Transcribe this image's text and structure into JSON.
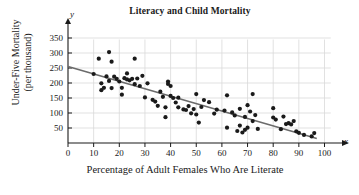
{
  "chart_data": {
    "type": "scatter",
    "title": "Literacy and Child Mortality",
    "xlabel": "Percentage of Adult Females Who Are Literate",
    "ylabel_line1": "Under-Five Mortality",
    "ylabel_line2": "(per thousand)",
    "x_axis_symbol": "x",
    "y_axis_symbol": "y",
    "xlim": [
      0,
      104
    ],
    "ylim": [
      0,
      365
    ],
    "xticks": [
      0,
      10,
      20,
      30,
      40,
      50,
      60,
      70,
      80,
      90,
      100
    ],
    "yticks": [
      50,
      100,
      150,
      200,
      250,
      300,
      350
    ],
    "grid": true,
    "legend": "none",
    "point_color": "#1a1a1a",
    "line_color": "#6b6b6b",
    "grid_color": "#d9d9d9",
    "trendline": {
      "label": "regression line",
      "x": [
        0,
        97
      ],
      "y": [
        255,
        15
      ]
    },
    "points": [
      [
        10,
        230
      ],
      [
        12,
        281
      ],
      [
        13,
        176
      ],
      [
        13,
        199
      ],
      [
        14,
        184
      ],
      [
        15,
        222
      ],
      [
        16,
        303
      ],
      [
        16,
        207
      ],
      [
        17,
        271
      ],
      [
        17,
        183
      ],
      [
        18,
        221
      ],
      [
        19,
        214
      ],
      [
        20,
        205
      ],
      [
        21,
        184
      ],
      [
        21,
        161
      ],
      [
        22,
        216
      ],
      [
        23,
        232
      ],
      [
        23,
        212
      ],
      [
        24,
        209
      ],
      [
        25,
        214
      ],
      [
        26,
        281
      ],
      [
        26,
        196
      ],
      [
        27,
        215
      ],
      [
        28,
        190
      ],
      [
        29,
        224
      ],
      [
        30,
        152
      ],
      [
        31,
        199
      ],
      [
        33,
        144
      ],
      [
        34,
        138
      ],
      [
        35,
        124
      ],
      [
        36,
        171
      ],
      [
        37,
        154
      ],
      [
        38,
        119
      ],
      [
        38,
        86
      ],
      [
        39,
        205
      ],
      [
        39,
        197
      ],
      [
        40,
        190
      ],
      [
        40,
        157
      ],
      [
        41,
        150
      ],
      [
        42,
        135
      ],
      [
        43,
        151
      ],
      [
        43,
        119
      ],
      [
        45,
        112
      ],
      [
        46,
        110
      ],
      [
        47,
        123
      ],
      [
        48,
        99
      ],
      [
        49,
        113
      ],
      [
        50,
        163
      ],
      [
        50,
        95
      ],
      [
        51,
        68
      ],
      [
        52,
        120
      ],
      [
        53,
        143
      ],
      [
        55,
        136
      ],
      [
        57,
        98
      ],
      [
        58,
        111
      ],
      [
        61,
        108
      ],
      [
        62,
        159
      ],
      [
        62,
        51
      ],
      [
        64,
        102
      ],
      [
        65,
        92
      ],
      [
        66,
        40
      ],
      [
        67,
        114
      ],
      [
        67,
        58
      ],
      [
        68,
        35
      ],
      [
        69,
        87
      ],
      [
        69,
        44
      ],
      [
        70,
        126
      ],
      [
        70,
        51
      ],
      [
        71,
        105
      ],
      [
        72,
        163
      ],
      [
        72,
        73
      ],
      [
        73,
        93
      ],
      [
        74,
        47
      ],
      [
        80,
        116
      ],
      [
        80,
        85
      ],
      [
        81,
        78
      ],
      [
        83,
        46
      ],
      [
        84,
        88
      ],
      [
        85,
        63
      ],
      [
        86,
        66
      ],
      [
        87,
        62
      ],
      [
        88,
        73
      ],
      [
        89,
        39
      ],
      [
        90,
        34
      ],
      [
        92,
        27
      ],
      [
        95,
        22
      ],
      [
        96,
        33
      ]
    ]
  }
}
